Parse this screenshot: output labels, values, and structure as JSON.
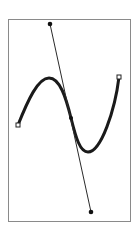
{
  "diagram": {
    "colors": {
      "background": "#ffffff",
      "frame": "#8a8a8a",
      "curve": "#1a1a1a",
      "handle_line": "#2a2a2a",
      "handle_point": "#111111",
      "endpoint_fill": "#ffffff",
      "endpoint_stroke": "#222222"
    },
    "frame": {
      "x": 8,
      "y": 19,
      "width": 122,
      "height": 202
    },
    "curve": {
      "start": {
        "x": 18,
        "y": 125
      },
      "peak": {
        "x": 48,
        "y": 78
      },
      "anchor": {
        "x": 71,
        "y": 118
      },
      "trough": {
        "x": 87,
        "y": 152
      },
      "end": {
        "x": 119,
        "y": 77
      },
      "path": "M18,125 C28,100 38,78 49,78 C60,78 66,98 71,118 C76,138 80,152 88,152 C101,152 115,110 119,77"
    },
    "handle": {
      "top": {
        "x": 50,
        "y": 24
      },
      "bottom": {
        "x": 91,
        "y": 212
      }
    }
  }
}
